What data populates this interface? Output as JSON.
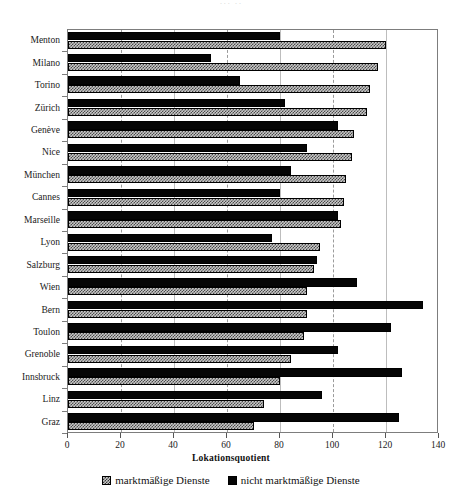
{
  "title_remnant": "··· ··",
  "chart_data": {
    "type": "bar",
    "orientation": "horizontal",
    "title": "",
    "xlabel": "Lokationsquotient",
    "ylabel": "",
    "xlim": [
      0,
      140
    ],
    "xticks": [
      0,
      20,
      40,
      60,
      80,
      100,
      120,
      140
    ],
    "xticklabels": [
      "0",
      "20",
      "40",
      "60",
      "80",
      "100",
      "120",
      "140"
    ],
    "grid": "vertical-dashed",
    "legend_position": "bottom-center",
    "categories": [
      "Menton",
      "Milano",
      "Torino",
      "Zürich",
      "Genève",
      "Nice",
      "München",
      "Cannes",
      "Marseille",
      "Lyon",
      "Salzburg",
      "Wien",
      "Bern",
      "Toulon",
      "Grenoble",
      "Innsbruck",
      "Linz",
      "Graz"
    ],
    "series": [
      {
        "name": "marktmäßige Dienste",
        "fill": "hatched-gray",
        "color": "#c8c8c8",
        "values": [
          120,
          117,
          114,
          113,
          108,
          107,
          105,
          104,
          103,
          95,
          93,
          90,
          90,
          89,
          84,
          80,
          74,
          70
        ]
      },
      {
        "name": "nicht marktmäßige Dienste",
        "fill": "solid-black",
        "color": "#050505",
        "values": [
          80,
          54,
          65,
          82,
          102,
          90,
          84,
          80,
          102,
          77,
          94,
          109,
          134,
          122,
          102,
          126,
          96,
          125
        ]
      }
    ]
  },
  "legend": {
    "items": [
      {
        "label": "marktmäßige Dienste",
        "style": "hatch"
      },
      {
        "label": "nicht marktmäßige Dienste",
        "style": "black"
      }
    ]
  }
}
